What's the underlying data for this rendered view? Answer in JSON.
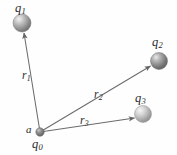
{
  "figure": {
    "width": 177,
    "height": 155,
    "background_color": "#fefefe",
    "line_color": "#5a5a5a",
    "text_color": "#2b2b2b"
  },
  "labels": {
    "q1": {
      "base": "q",
      "sub": "1"
    },
    "q2": {
      "base": "q",
      "sub": "2"
    },
    "q3": {
      "base": "q",
      "sub": "3"
    },
    "q0": {
      "base": "q",
      "sub": "0"
    },
    "a": {
      "base": "a",
      "sub": ""
    },
    "r1": {
      "base": "r",
      "sub": "1"
    },
    "r2": {
      "base": "r",
      "sub": "2"
    },
    "r3": {
      "base": "r",
      "sub": "3"
    }
  },
  "charges": [
    {
      "name": "q1",
      "cx": 22,
      "cy": 23,
      "r": 9,
      "fill": "#8e8e8e",
      "highlight": "#e2e2e2"
    },
    {
      "name": "q2",
      "cx": 159,
      "cy": 61,
      "r": 8.5,
      "fill": "#7d7d7d",
      "highlight": "#dcdcdc"
    },
    {
      "name": "q3",
      "cx": 143,
      "cy": 114,
      "r": 8.5,
      "fill": "#a8a8a8",
      "highlight": "#ececec"
    },
    {
      "name": "q0",
      "cx": 40,
      "cy": 132,
      "r": 4.2,
      "fill": "#6f6f6f",
      "highlight": "#c8c8c8"
    }
  ],
  "vectors": [
    {
      "name": "r1",
      "x1": 40,
      "y1": 132,
      "x2": 24,
      "y2": 33
    },
    {
      "name": "r2",
      "x1": 40,
      "y1": 132,
      "x2": 150,
      "y2": 66
    },
    {
      "name": "r3",
      "x1": 40,
      "y1": 132,
      "x2": 134,
      "y2": 118
    }
  ]
}
